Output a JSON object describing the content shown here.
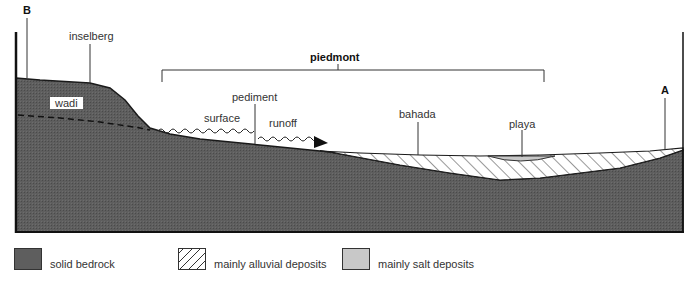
{
  "diagram": {
    "type": "geological cross-section",
    "labels": {
      "point_b": "B",
      "point_a": "A",
      "inselberg": "inselberg",
      "wadi": "wadi",
      "piedmont": "piedmont",
      "pediment": "pediment",
      "surface": "surface",
      "runoff": "runoff",
      "bahada": "bahada",
      "playa": "playa"
    },
    "colors": {
      "bedrock": "#5a5a5a",
      "alluvial_bg": "#ffffff",
      "alluvial_hatch": "#333333",
      "salt": "#c8c8c8",
      "outline": "#1a1a1a"
    }
  },
  "legend": {
    "items": [
      {
        "label": "solid bedrock",
        "pattern": "bedrock"
      },
      {
        "label": "mainly alluvial deposits",
        "pattern": "hatch"
      },
      {
        "label": "mainly salt deposits",
        "pattern": "salt"
      }
    ]
  }
}
